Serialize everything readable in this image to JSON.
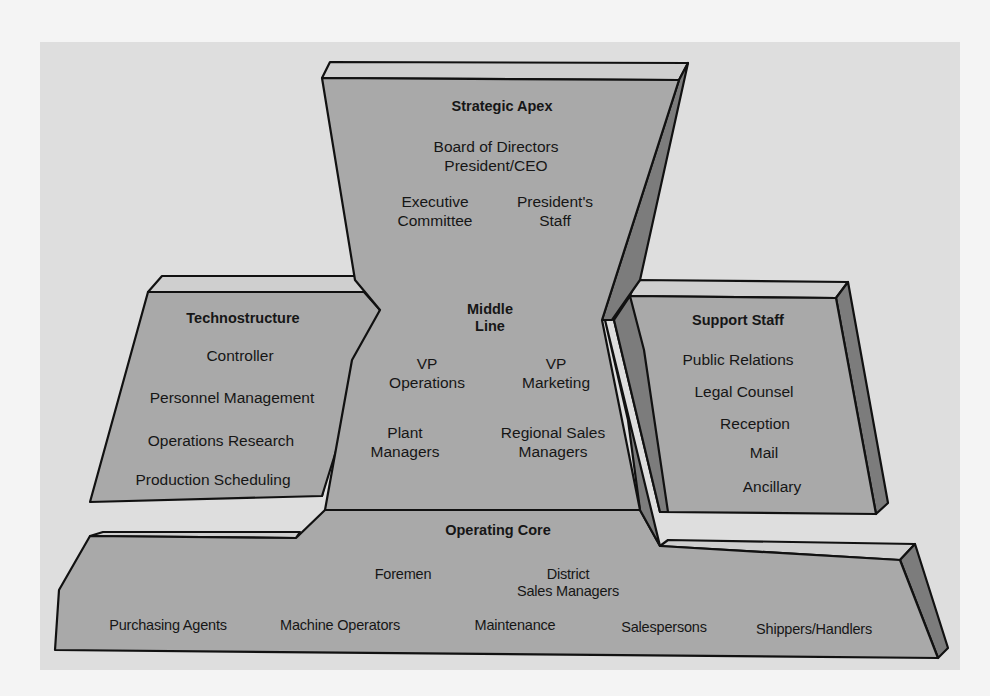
{
  "diagram": {
    "colors": {
      "background": "#f4f4f4",
      "panel": "#dedede",
      "face": "#a9a9a9",
      "bevel_top": "#cfcfcf",
      "bevel_side": "#7c7c7c",
      "outline": "#111111",
      "text": "#161616"
    },
    "strategic_apex": {
      "title": "Strategic Apex",
      "line1": "Board of Directors\nPresident/CEO",
      "left": "Executive\nCommittee",
      "right": "President's\nStaff"
    },
    "middle_line": {
      "title": "Middle\nLine",
      "vp_operations": "VP\nOperations",
      "vp_marketing": "VP\nMarketing",
      "plant_managers": "Plant\nManagers",
      "regional_sales_managers": "Regional Sales\nManagers"
    },
    "technostructure": {
      "title": "Technostructure",
      "items": [
        "Controller",
        "Personnel Management",
        "Operations Research",
        "Production Scheduling"
      ]
    },
    "support_staff": {
      "title": "Support Staff",
      "items": [
        "Public Relations",
        "Legal Counsel",
        "Reception",
        "Mail",
        "Ancillary"
      ]
    },
    "operating_core": {
      "title": "Operating Core",
      "foremen": "Foremen",
      "district_sales_managers": "District\nSales Managers",
      "items": [
        "Purchasing Agents",
        "Machine Operators",
        "Maintenance",
        "Salespersons",
        "Shippers/Handlers"
      ]
    }
  }
}
